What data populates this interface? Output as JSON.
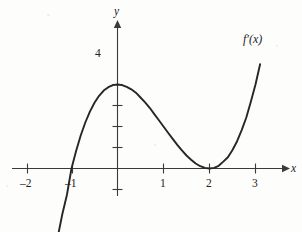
{
  "figure": {
    "caption_text": "",
    "background_color": "#fdfdfc",
    "curve_color": "#262626",
    "axis_color": "#3a3a3a"
  },
  "axes": {
    "x_axis_label": "x",
    "y_axis_label": "y",
    "x_ticks": [
      {
        "label": "–2",
        "value": -2
      },
      {
        "label": "–1",
        "value": -1
      },
      {
        "label": "1",
        "value": 1
      },
      {
        "label": "2",
        "value": 2
      },
      {
        "label": "3",
        "value": 3
      }
    ],
    "y_ticks": [
      {
        "label": "",
        "value": -1
      },
      {
        "label": "",
        "value": 1
      },
      {
        "label": "",
        "value": 2
      },
      {
        "label": "",
        "value": 3
      },
      {
        "label": "4",
        "value": 4
      }
    ]
  },
  "curve": {
    "label": "f′(x)",
    "label_name": "f-prime-of-x"
  },
  "chart_data": {
    "type": "line",
    "title": "",
    "subtitle": "",
    "xlabel": "x",
    "ylabel": "y",
    "xlim": [
      -2.4,
      3.6
    ],
    "ylim": [
      -2.2,
      5.2
    ],
    "grid": false,
    "legend": "inline-curve-label",
    "annotations": [
      {
        "text": "f′(x)",
        "x": 3.1,
        "y": 4.6
      },
      {
        "text": "4",
        "x": -0.35,
        "y": 4.0
      }
    ],
    "xticks": [
      -2,
      -1,
      1,
      2,
      3
    ],
    "xticklabels": [
      "–2",
      "–1",
      "1",
      "2",
      "3"
    ],
    "yticks": [
      -1,
      1,
      2,
      3,
      4
    ],
    "yticklabels": [
      "",
      "",
      "",
      "",
      "4"
    ],
    "series": [
      {
        "name": "f'(x)",
        "equation": "(x + 1)(x - 2)^2",
        "roots": [
          -1,
          2
        ],
        "local_maximum": {
          "x": 0,
          "y": 4
        },
        "local_minimum": {
          "x": 2,
          "y": 0
        },
        "x": [
          -1.3,
          -1.2,
          -1.1,
          -1.0,
          -0.9,
          -0.8,
          -0.7,
          -0.6,
          -0.5,
          -0.4,
          -0.3,
          -0.2,
          -0.1,
          0.0,
          0.1,
          0.2,
          0.3,
          0.4,
          0.5,
          0.6,
          0.7,
          0.8,
          0.9,
          1.0,
          1.1,
          1.2,
          1.3,
          1.4,
          1.5,
          1.6,
          1.7,
          1.8,
          1.9,
          2.0,
          2.1,
          2.2,
          2.3,
          2.4,
          2.5,
          2.6,
          2.7,
          2.8,
          2.9,
          3.0,
          3.1
        ],
        "y": [
          -3.27,
          -2.18,
          -1.26,
          0.0,
          0.84,
          1.57,
          2.19,
          2.71,
          3.13,
          3.46,
          3.71,
          3.87,
          3.97,
          4.0,
          3.97,
          3.89,
          3.77,
          3.61,
          3.38,
          3.15,
          2.89,
          2.59,
          2.3,
          2.0,
          1.7,
          1.41,
          1.13,
          0.86,
          0.62,
          0.42,
          0.24,
          0.11,
          0.03,
          0.0,
          0.03,
          0.13,
          0.33,
          0.54,
          0.88,
          1.3,
          1.83,
          2.43,
          3.19,
          4.0,
          4.96
        ]
      }
    ]
  }
}
